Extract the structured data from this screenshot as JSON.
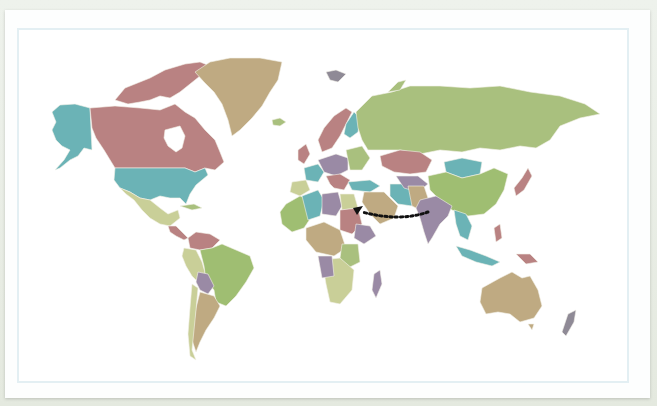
{
  "map": {
    "projection": "Miller-like world projection",
    "palette": {
      "rose": "#b98282",
      "teal": "#6bb3b6",
      "sage": "#a9c07e",
      "tan": "#bfaa82",
      "lilac": "#9a8aa5",
      "green": "#9fbe72",
      "pale": "#c9cf98",
      "grey": "#8f8a96"
    },
    "regions": [
      {
        "name": "Canada",
        "color": "rose"
      },
      {
        "name": "Alaska / USA",
        "color": "teal"
      },
      {
        "name": "Greenland",
        "color": "tan"
      },
      {
        "name": "Mexico",
        "color": "pale"
      },
      {
        "name": "Brazil",
        "color": "green"
      },
      {
        "name": "Argentina",
        "color": "tan"
      },
      {
        "name": "Russia",
        "color": "sage"
      },
      {
        "name": "Kazakhstan",
        "color": "rose"
      },
      {
        "name": "Mongolia",
        "color": "teal"
      },
      {
        "name": "China",
        "color": "green"
      },
      {
        "name": "India",
        "color": "lilac"
      },
      {
        "name": "Australia",
        "color": "tan"
      },
      {
        "name": "New Zealand",
        "color": "grey"
      },
      {
        "name": "Madagascar",
        "color": "lilac"
      },
      {
        "name": "Algeria",
        "color": "teal"
      },
      {
        "name": "Libya",
        "color": "lilac"
      },
      {
        "name": "Egypt",
        "color": "pale"
      },
      {
        "name": "Sudan",
        "color": "rose"
      },
      {
        "name": "Saudi Arabia",
        "color": "tan"
      },
      {
        "name": "Iran",
        "color": "teal"
      }
    ],
    "annotation": {
      "type": "dotted-arrow",
      "from": "India (west coast)",
      "to": "Egypt / Red Sea",
      "color": "#111111"
    }
  }
}
